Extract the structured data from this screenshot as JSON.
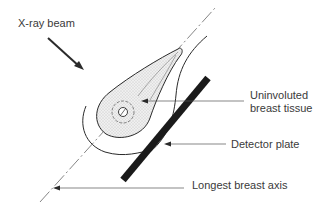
{
  "diagram": {
    "labels": {
      "xray_beam": "X-ray beam",
      "tissue_line1": "Uninvoluted",
      "tissue_line2": "breast tissue",
      "detector_plate": "Detector plate",
      "longest_axis": "Longest breast axis"
    },
    "colors": {
      "stroke": "#2a2a2a",
      "stipple_fill": "#e4e4e4",
      "detector": "#1a1a1a",
      "text": "#3a3a3a"
    }
  }
}
